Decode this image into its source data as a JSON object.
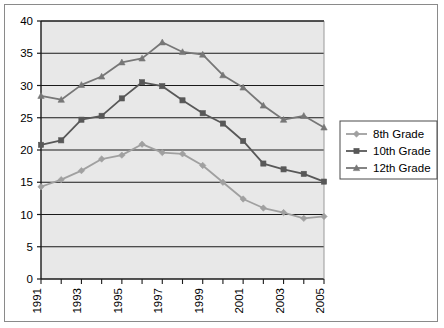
{
  "chart_data": {
    "type": "line",
    "title": "",
    "subtitle": "",
    "xlabel": "",
    "ylabel": "",
    "x": [
      1991,
      1992,
      1993,
      1994,
      1995,
      1996,
      1997,
      1998,
      1999,
      2000,
      2001,
      2002,
      2003,
      2004,
      2005
    ],
    "categories": [
      "1991",
      "1992",
      "1993",
      "1994",
      "1995",
      "1996",
      "1997",
      "1998",
      "1999",
      "2000",
      "2001",
      "2002",
      "2003",
      "2004",
      "2005"
    ],
    "xtick_labels": [
      "1991",
      "",
      "1993",
      "",
      "1995",
      "",
      "1997",
      "",
      "1999",
      "",
      "2001",
      "",
      "2003",
      "",
      "2005"
    ],
    "xtick_labels_shown": [
      "1991",
      "1993",
      "1995",
      "1997",
      "1999",
      "2001",
      "2003",
      "2005"
    ],
    "ytick_labels": [
      "0",
      "5",
      "10",
      "15",
      "20",
      "25",
      "30",
      "35",
      "40"
    ],
    "yticks": [
      0,
      5,
      10,
      15,
      20,
      25,
      30,
      35,
      40
    ],
    "ylim": [
      0,
      40
    ],
    "xlim": [
      1991,
      2005
    ],
    "grid": "horizontal",
    "legend_position": "right",
    "plot_background": "#e8e8e8",
    "series": [
      {
        "name": "8th Grade",
        "marker": "diamond",
        "color": "#a0a0a0",
        "values": [
          14.3,
          15.4,
          16.8,
          18.6,
          19.2,
          20.9,
          19.6,
          19.4,
          17.6,
          15.0,
          12.4,
          11.0,
          10.3,
          9.4,
          9.7
        ]
      },
      {
        "name": "10th Grade",
        "marker": "square",
        "color": "#585858",
        "values": [
          20.8,
          21.5,
          24.7,
          25.3,
          28.0,
          30.5,
          29.9,
          27.7,
          25.7,
          24.1,
          21.4,
          17.9,
          17.0,
          16.3,
          15.1
        ]
      },
      {
        "name": "12th Grade",
        "marker": "triangle",
        "color": "#777777",
        "values": [
          28.4,
          27.8,
          30.1,
          31.4,
          33.6,
          34.2,
          36.7,
          35.2,
          34.8,
          31.6,
          29.7,
          26.9,
          24.7,
          25.3,
          23.5
        ]
      }
    ]
  },
  "legend": {
    "entries": [
      {
        "label": "8th Grade"
      },
      {
        "label": "10th Grade"
      },
      {
        "label": "12th Grade"
      }
    ]
  }
}
